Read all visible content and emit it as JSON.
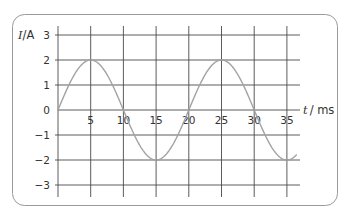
{
  "chart_data": {
    "type": "line",
    "title": "",
    "xlabel": "t / ms",
    "ylabel": "I /A",
    "xlabel_var": "t",
    "xlabel_unit": "/ ms",
    "ylabel_var": "I",
    "ylabel_unit": "/A",
    "xlim": [
      0,
      37
    ],
    "ylim": [
      -3,
      3
    ],
    "x_ticks": [
      5,
      10,
      15,
      20,
      25,
      30,
      35
    ],
    "y_ticks": [
      3,
      2,
      1,
      0,
      -1,
      -2,
      -3
    ],
    "grid": true,
    "legend": null,
    "series": [
      {
        "name": "current",
        "function": "I = 2 sin(2π t / 20)",
        "amplitude": 2,
        "period_ms": 20,
        "x": [
          0,
          2.5,
          5,
          7.5,
          10,
          12.5,
          15,
          17.5,
          20,
          22.5,
          25,
          27.5,
          30,
          32.5,
          35,
          36.5
        ],
        "values": [
          0,
          1.41,
          2,
          1.41,
          0,
          -1.41,
          -2,
          -1.41,
          0,
          1.41,
          2,
          1.41,
          0,
          -1.41,
          -2,
          -1.78
        ]
      }
    ]
  },
  "colors": {
    "grid": "#4a4a4a",
    "curve": "#a3a3a3",
    "frame": "#9a9a9a",
    "text": "#333333"
  }
}
